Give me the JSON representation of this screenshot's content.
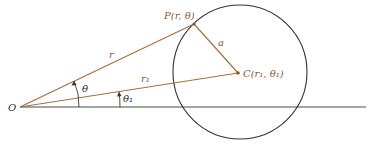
{
  "diagram": {
    "colors": {
      "axis": "#4a4a4a",
      "circle": "#333333",
      "segments": "#a8703f",
      "labels_dark": "#2a2a2a",
      "labels_brown": "#8a5a33"
    },
    "labels": {
      "origin": "O",
      "point_p": "P(r, θ)",
      "point_c": "C(r₁, θ₁)",
      "radius_a": "a",
      "segment_r": "r",
      "segment_r1": "r₁",
      "angle_theta": "θ",
      "angle_theta1": "θ₁"
    },
    "geometry": {
      "origin": [
        20,
        107
      ],
      "point_p": [
        194,
        24
      ],
      "point_c": [
        238,
        73
      ],
      "circle_center": [
        240,
        72
      ],
      "circle_radius": 67,
      "axis_end": [
        366,
        107
      ]
    }
  }
}
